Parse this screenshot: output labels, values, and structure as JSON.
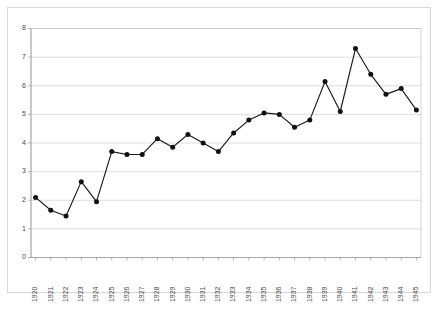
{
  "chart_data": {
    "type": "line",
    "title": "",
    "subtitle": "",
    "xlabel": "",
    "ylabel": "",
    "categories": [
      "1920",
      "1921",
      "1922",
      "1923",
      "1924",
      "1925",
      "1926",
      "1927",
      "1928",
      "1929",
      "1930",
      "1931",
      "1932",
      "1933",
      "1934",
      "1935",
      "1936",
      "1937",
      "1938",
      "1939",
      "1940",
      "1941",
      "1942",
      "1943",
      "1944",
      "1945"
    ],
    "values": [
      2.1,
      1.65,
      1.45,
      2.65,
      1.95,
      3.7,
      3.6,
      3.6,
      4.15,
      3.85,
      4.3,
      4.0,
      3.7,
      4.35,
      4.8,
      5.05,
      5.0,
      4.55,
      4.8,
      6.15,
      5.1,
      7.3,
      6.4,
      5.7,
      5.9,
      5.15
    ],
    "series": [
      {
        "name": "series-1",
        "values": [
          2.1,
          1.65,
          1.45,
          2.65,
          1.95,
          3.7,
          3.6,
          3.6,
          4.15,
          3.85,
          4.3,
          4.0,
          3.7,
          4.35,
          4.8,
          5.05,
          5.0,
          4.55,
          4.8,
          6.15,
          5.1,
          7.3,
          6.4,
          5.7,
          5.9,
          5.15
        ],
        "color": "#111111",
        "marker": "filled-circle"
      }
    ],
    "ylim": [
      0,
      8
    ],
    "yticks": [
      0,
      1,
      2,
      3,
      4,
      5,
      6,
      7,
      8
    ],
    "ytick_labels": [
      "0",
      "1",
      "2",
      "3",
      "4",
      "5",
      "6",
      "7",
      "8"
    ],
    "xtick_labels": [
      "1920",
      "1921",
      "1922",
      "1923",
      "1924",
      "1925",
      "1926",
      "1927",
      "1928",
      "1929",
      "1930",
      "1931",
      "1932",
      "1933",
      "1934",
      "1935",
      "1936",
      "1937",
      "1938",
      "1939",
      "1940",
      "1941",
      "1942",
      "1943",
      "1944",
      "1945"
    ],
    "xtick_rotation": 90,
    "grid": {
      "horizontal": true,
      "vertical": false,
      "color": "#cfcfcf"
    },
    "legend": {
      "visible": false,
      "position": "none"
    },
    "line_color": "#111111",
    "marker_color": "#111111",
    "plot_background": "#ffffff",
    "border_color": "#c8c8c8"
  }
}
